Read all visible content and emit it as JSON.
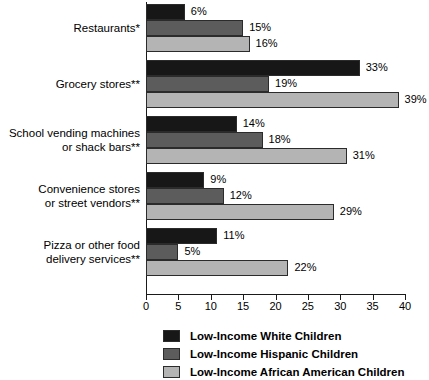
{
  "chart_data": {
    "type": "bar",
    "orientation": "horizontal",
    "title": "",
    "subtitle": "",
    "xlabel": "",
    "ylabel": "",
    "xlim": [
      0,
      40
    ],
    "xticks": [
      0,
      5,
      10,
      15,
      20,
      25,
      30,
      35,
      40
    ],
    "xtick_labels": [
      "0",
      "5",
      "10",
      "15",
      "20",
      "25",
      "30",
      "35",
      "40"
    ],
    "grid": false,
    "legend_position": "bottom",
    "value_label_suffix": "%",
    "categories": [
      "Restaurants*",
      "Grocery stores**",
      "School vending machines or shack bars**",
      "Convenience stores or street vendors**",
      "Pizza or other food delivery services**"
    ],
    "category_lines": [
      [
        "Restaurants*"
      ],
      [
        "Grocery stores**"
      ],
      [
        "School vending machines",
        "or shack bars**"
      ],
      [
        "Convenience stores",
        "or street vendors**"
      ],
      [
        "Pizza or other food",
        "delivery services**"
      ]
    ],
    "series": [
      {
        "name": "Low-Income White Children",
        "color": "#171717",
        "values": [
          6,
          33,
          14,
          9,
          11
        ],
        "value_labels": [
          "6%",
          "33%",
          "14%",
          "9%",
          "11%"
        ]
      },
      {
        "name": "Low-Income Hispanic Children",
        "color": "#5c5c5c",
        "values": [
          15,
          19,
          18,
          12,
          5
        ],
        "value_labels": [
          "15%",
          "19%",
          "18%",
          "12%",
          "5%"
        ]
      },
      {
        "name": "Low-Income African American Children",
        "color": "#b4b4b4",
        "values": [
          16,
          39,
          31,
          29,
          22
        ],
        "value_labels": [
          "16%",
          "39%",
          "31%",
          "29%",
          "22%"
        ]
      }
    ]
  },
  "legend": {
    "items": [
      {
        "label": "Low-Income White Children",
        "color": "#171717"
      },
      {
        "label": "Low-Income Hispanic Children",
        "color": "#5c5c5c"
      },
      {
        "label": "Low-Income African American Children",
        "color": "#b4b4b4"
      }
    ]
  },
  "axis": {
    "tick_labels": [
      "0",
      "5",
      "10",
      "15",
      "20",
      "25",
      "30",
      "35",
      "40"
    ]
  }
}
